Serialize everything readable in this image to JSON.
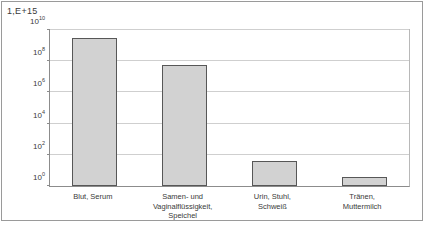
{
  "corner_label": "1,E+15",
  "chart_data": {
    "type": "bar",
    "title": "",
    "subtitle": "",
    "xlabel": "",
    "ylabel": "",
    "scale": "log10",
    "grid": "horizontal",
    "legend": "none",
    "orientation": "vertical",
    "bar_fill_color": "#d2d2d2",
    "bar_border_color": "#575757",
    "gridline_color": "#cfcfcf",
    "axis_color": "#8c8c8c",
    "ylim": [
      1,
      10000000000
    ],
    "ytick_exponents": [
      0,
      2,
      4,
      6,
      8,
      10
    ],
    "yticks": [
      {
        "label_base": "10",
        "label_exp": "0",
        "exponent": 0
      },
      {
        "label_base": "10",
        "label_exp": "2",
        "exponent": 2
      },
      {
        "label_base": "10",
        "label_exp": "4",
        "exponent": 4
      },
      {
        "label_base": "10",
        "label_exp": "6",
        "exponent": 6
      },
      {
        "label_base": "10",
        "label_exp": "8",
        "exponent": 8
      },
      {
        "label_base": "10",
        "label_exp": "10",
        "exponent": 10
      }
    ],
    "categories": [
      "Blut, Serum",
      "Samen- und Vaginalflüssigkeit, Speichel",
      "Urin, Stuhl, Schweiß",
      "Tränen, Muttermilch"
    ],
    "category_lines": [
      [
        "Blut, Serum"
      ],
      [
        "Samen- und",
        "Vaginalflüssigkeit,",
        "Speichel"
      ],
      [
        "Urin, Stuhl,",
        "Schweiß"
      ],
      [
        "Tränen,",
        "Muttermilch"
      ]
    ],
    "values": [
      3000000000,
      60000000,
      40,
      4
    ],
    "value_exponents": [
      9.48,
      7.78,
      1.6,
      0.6
    ]
  }
}
